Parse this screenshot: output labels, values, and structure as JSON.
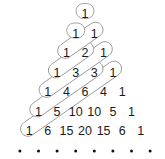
{
  "diagram": {
    "rows": [
      [
        "1"
      ],
      [
        "1",
        "1"
      ],
      [
        "1",
        "2",
        "1"
      ],
      [
        "1",
        "3",
        "3",
        "1"
      ],
      [
        "1",
        "4",
        "6",
        "4",
        "1"
      ],
      [
        "1",
        "5",
        "10",
        "10",
        "5",
        "1"
      ],
      [
        "1",
        "6",
        "15",
        "20",
        "15",
        "6",
        "1"
      ]
    ],
    "continuation_dots": 9,
    "colors": {
      "text": "#1a1a1a",
      "capsule_stroke": "#9a9a9a",
      "dot": "#111111"
    }
  }
}
